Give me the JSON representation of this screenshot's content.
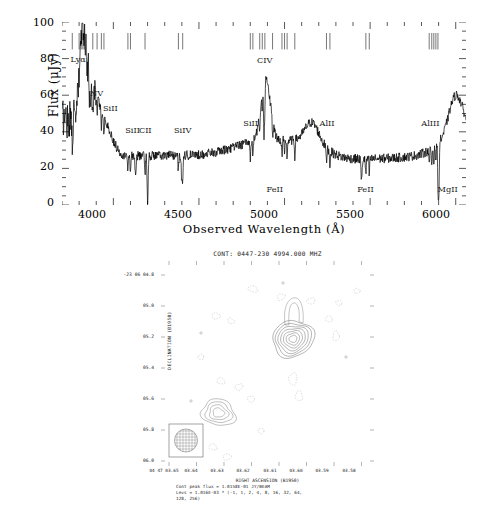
{
  "figure": {
    "panels": [
      "quasar-spectrum",
      "radio-continuum-map"
    ]
  },
  "spectrum": {
    "xlabel": "Observed Wavelength (Å)",
    "ylabel": "Flux (μJy)",
    "xticks": [
      "4000",
      "4500",
      "5000",
      "5500",
      "6000"
    ],
    "yticks": [
      "0",
      "20",
      "40",
      "60",
      "80",
      "100"
    ],
    "line_labels": [
      {
        "text": "Lyα",
        "x": 3790,
        "y": 80
      },
      {
        "text": "NV",
        "x": 3905,
        "y": 61
      },
      {
        "text": "SiII",
        "x": 3980,
        "y": 53
      },
      {
        "text": "SiII",
        "x": 4110,
        "y": 41
      },
      {
        "text": "CII",
        "x": 4190,
        "y": 41
      },
      {
        "text": "SiIV",
        "x": 4395,
        "y": 41
      },
      {
        "text": "SiII",
        "x": 4800,
        "y": 45
      },
      {
        "text": "CIV",
        "x": 4880,
        "y": 79
      },
      {
        "text": "FeII",
        "x": 4935,
        "y": 9
      },
      {
        "text": "AlII",
        "x": 5245,
        "y": 45
      },
      {
        "text": "FeII",
        "x": 5465,
        "y": 9
      },
      {
        "text": "AlIII",
        "x": 5840,
        "y": 45
      },
      {
        "text": "MgII",
        "x": 5935,
        "y": 9
      }
    ]
  },
  "radio_map": {
    "title": "CONT: 0447-230    4994.000 MHZ",
    "dec_axis_label": "DECLINATION (B1950)",
    "ra_axis_label": "RIGHT ASCENSION (B1950)",
    "dec_ticks": [
      "-23 06 04.8",
      "05.0",
      "05.2",
      "05.4",
      "05.6",
      "05.8",
      "06.0"
    ],
    "ra_ticks": [
      "04 47 03.65",
      "03.64",
      "03.63",
      "03.62",
      "03.61",
      "03.60",
      "03.59",
      "03.58"
    ],
    "footer": [
      "Cont peak flux =  1.0158E-01 JY/BEAM",
      "Levs = 1.016E-03 * (-1, 1, 2, 4, 8, 16, 32, 64,",
      "128, 256)"
    ]
  },
  "chart_data": {
    "type": "line",
    "xlabel": "Observed Wavelength (Å)",
    "ylabel": "Flux (μJy)",
    "xlim": [
      3700,
      6060
    ],
    "ylim": [
      0,
      100
    ],
    "grid": false,
    "legend": "none",
    "emission_features": [
      {
        "name": "Lyα",
        "wavelength": 3820,
        "peak_flux": 95
      },
      {
        "name": "NV",
        "wavelength": 3880,
        "peak_flux": 60
      },
      {
        "name": "SiII",
        "wavelength": 3960,
        "peak_flux": 40
      },
      {
        "name": "CIV",
        "wavelength": 4890,
        "peak_flux": 70
      },
      {
        "name": "AlII",
        "wavelength": 5160,
        "peak_flux": 45
      },
      {
        "name": "MgII",
        "wavelength": 6000,
        "peak_flux": 60
      }
    ],
    "absorption_features": [
      {
        "name": "SiII",
        "wavelength": 4130,
        "min_flux": 15
      },
      {
        "name": "CII",
        "wavelength": 4200,
        "min_flux": 2
      },
      {
        "name": "SiIV",
        "wavelength": 4400,
        "min_flux": 13
      },
      {
        "name": "FeII",
        "wavelength": 4880,
        "min_flux": 7
      },
      {
        "name": "FeII",
        "wavelength": 5450,
        "min_flux": 13
      },
      {
        "name": "MgII",
        "wavelength": 5900,
        "min_flux": 1
      }
    ],
    "continuum_level": 27,
    "absorption_ticks": [
      3760,
      3800,
      3812,
      3822,
      3830,
      3880,
      3905,
      3930,
      3945,
      4085,
      4100,
      4185,
      4380,
      4405,
      4800,
      4815,
      4855,
      4870,
      4885,
      4930,
      4985,
      5000,
      5015,
      5060,
      5245,
      5265,
      5475,
      5495,
      5845,
      5860,
      5872,
      5884,
      5896
    ],
    "map": {
      "type": "contour",
      "frequency_mhz": 4994.0,
      "source": "0447-230",
      "peak_flux_jy_per_beam": 0.10158,
      "contour_base": 0.001016,
      "contour_multipliers": [
        -1,
        1,
        2,
        4,
        8,
        16,
        32,
        64,
        128,
        256
      ],
      "components": [
        {
          "name": "primary-component",
          "rel_x": 0.62,
          "rel_y": 0.38,
          "levels": 7
        },
        {
          "name": "secondary-component",
          "rel_x": 0.27,
          "rel_y": 0.74,
          "levels": 4
        }
      ]
    }
  }
}
